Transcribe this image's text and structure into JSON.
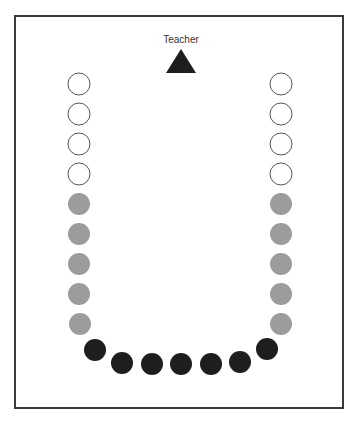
{
  "diagram": {
    "type": "classroom-seating-u-shape",
    "teacher_label": "Teacher",
    "colors": {
      "border": "#3a3a3a",
      "teacher": "#1e1e1e",
      "empty_seat_stroke": "#555555",
      "gray_seat": "#9c9c9c",
      "dark_seat": "#1e1e1e",
      "label": "#333333"
    },
    "teacher": {
      "x": 181,
      "apex_y": 49,
      "base_y": 73,
      "half_width": 15,
      "label_y": 43
    },
    "seat_radius": 11,
    "left_column": [
      {
        "x": 79,
        "y": 84,
        "kind": "empty"
      },
      {
        "x": 79,
        "y": 114,
        "kind": "empty"
      },
      {
        "x": 79,
        "y": 144,
        "kind": "empty"
      },
      {
        "x": 79,
        "y": 174,
        "kind": "empty"
      },
      {
        "x": 79,
        "y": 204,
        "kind": "gray"
      },
      {
        "x": 79,
        "y": 234,
        "kind": "gray"
      },
      {
        "x": 79,
        "y": 264,
        "kind": "gray"
      },
      {
        "x": 79,
        "y": 294,
        "kind": "gray"
      },
      {
        "x": 80,
        "y": 324,
        "kind": "gray"
      }
    ],
    "right_column": [
      {
        "x": 281,
        "y": 84,
        "kind": "empty"
      },
      {
        "x": 281,
        "y": 114,
        "kind": "empty"
      },
      {
        "x": 281,
        "y": 144,
        "kind": "empty"
      },
      {
        "x": 281,
        "y": 174,
        "kind": "empty"
      },
      {
        "x": 281,
        "y": 204,
        "kind": "gray"
      },
      {
        "x": 281,
        "y": 234,
        "kind": "gray"
      },
      {
        "x": 281,
        "y": 264,
        "kind": "gray"
      },
      {
        "x": 281,
        "y": 294,
        "kind": "gray"
      },
      {
        "x": 281,
        "y": 324,
        "kind": "gray"
      }
    ],
    "bottom_row": [
      {
        "x": 95,
        "y": 350,
        "kind": "dark"
      },
      {
        "x": 122,
        "y": 363,
        "kind": "dark"
      },
      {
        "x": 152,
        "y": 364,
        "kind": "dark"
      },
      {
        "x": 181,
        "y": 364,
        "kind": "dark"
      },
      {
        "x": 211,
        "y": 364,
        "kind": "dark"
      },
      {
        "x": 240,
        "y": 362,
        "kind": "dark"
      },
      {
        "x": 267,
        "y": 349,
        "kind": "dark"
      }
    ],
    "frame": {
      "x": 15,
      "y": 16,
      "width": 328,
      "height": 392
    }
  }
}
